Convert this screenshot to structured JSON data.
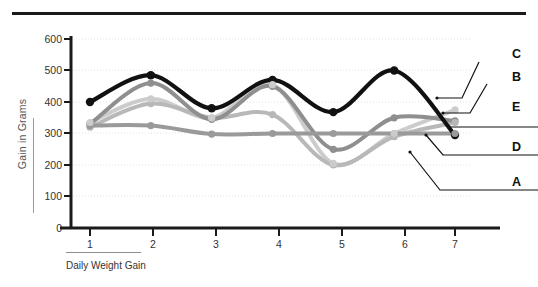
{
  "figure": {
    "top_rule": "horizontal-rule",
    "background": "#ffffff"
  },
  "chart_data": {
    "type": "line",
    "title": "",
    "xlabel": "Daily Weight Gain",
    "ylabel": "Gain in Grams",
    "categories": [
      "1",
      "2",
      "3",
      "4",
      "5",
      "6",
      "7"
    ],
    "x": [
      1,
      2,
      3,
      4,
      5,
      6,
      7
    ],
    "ylim": [
      0,
      600
    ],
    "xlim": [
      0.6,
      7.4
    ],
    "y_ticks": [
      0,
      100,
      200,
      300,
      400,
      500,
      600
    ],
    "x_ticks": [
      "1",
      "2",
      "3",
      "4",
      "5",
      "6",
      "7"
    ],
    "grid": "horizontal-dotted",
    "legend_position": "right-outside",
    "markers": "filled-circle",
    "smoothing": "spline",
    "series": [
      {
        "name": "A",
        "label": "A",
        "color": "#111111",
        "width": 4.2,
        "values": [
          400,
          485,
          380,
          470,
          368,
          500,
          295
        ]
      },
      {
        "name": "D",
        "label": "D",
        "color": "#8f8f8f",
        "width": 4.0,
        "values": [
          330,
          460,
          345,
          450,
          250,
          350,
          340
        ]
      },
      {
        "name": "E",
        "label": "E",
        "color": "#b8b8b8",
        "width": 4.0,
        "values": [
          320,
          395,
          350,
          360,
          200,
          290,
          335
        ]
      },
      {
        "name": "B",
        "label": "B",
        "color": "#9a9a9a",
        "width": 4.0,
        "values": [
          325,
          325,
          298,
          300,
          300,
          300,
          300
        ]
      },
      {
        "name": "C",
        "label": "C",
        "color": "#cccccc",
        "width": 4.0,
        "values": [
          335,
          410,
          350,
          455,
          205,
          300,
          375
        ]
      }
    ],
    "legend_entries": [
      {
        "label": "C",
        "color": "#cccccc"
      },
      {
        "label": "B",
        "color": "#9a9a9a"
      },
      {
        "label": "E",
        "color": "#b8b8b8"
      },
      {
        "label": "D",
        "color": "#8f8f8f"
      },
      {
        "label": "A",
        "color": "#111111"
      }
    ]
  }
}
